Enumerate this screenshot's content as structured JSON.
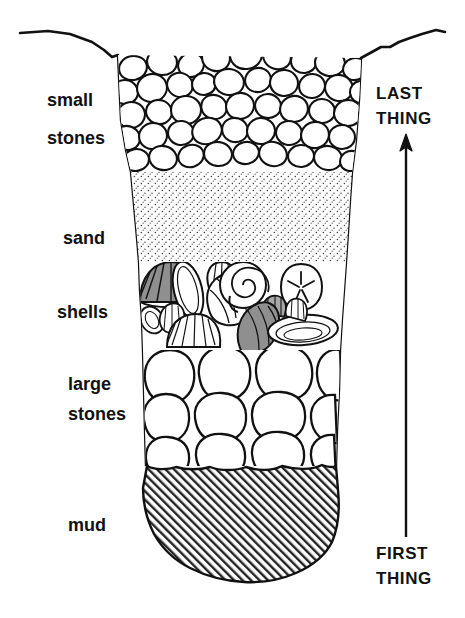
{
  "figure": {
    "type": "cross-section-diagram",
    "width": 465,
    "height": 618,
    "background_color": "#ffffff",
    "ink_color": "#111111"
  },
  "labels": {
    "small_stones_line1": "small",
    "small_stones_line2": "stones",
    "sand": "sand",
    "shells": "shells",
    "large_stones_line1": "large",
    "large_stones_line2": "stones",
    "mud": "mud"
  },
  "time_axis": {
    "top_line1": "LAST",
    "top_line2": "THING",
    "bottom_line1": "FIRST",
    "bottom_line2": "THING",
    "direction": "upward",
    "arrow_x": 406,
    "arrow_tip_y": 135,
    "arrow_tail_y": 537
  },
  "layers": [
    {
      "id": "small-stones",
      "name": "small stones",
      "order_from_top": 1,
      "deposition_order": 5,
      "fill_pattern": "small-pebbles",
      "top_y": 55,
      "bottom_y": 172,
      "fill_color": "#ffffff"
    },
    {
      "id": "sand",
      "name": "sand",
      "order_from_top": 2,
      "deposition_order": 4,
      "fill_pattern": "stipple-dots",
      "top_y": 172,
      "bottom_y": 262,
      "fill_color": "#ffffff"
    },
    {
      "id": "shells",
      "name": "shells",
      "order_from_top": 3,
      "deposition_order": 3,
      "fill_pattern": "shell-assemblage",
      "top_y": 262,
      "bottom_y": 350,
      "fill_color": "#ffffff"
    },
    {
      "id": "large-stones",
      "name": "large stones",
      "order_from_top": 4,
      "deposition_order": 2,
      "fill_pattern": "large-cobbles",
      "top_y": 350,
      "bottom_y": 466,
      "fill_color": "#ffffff"
    },
    {
      "id": "mud",
      "name": "mud",
      "order_from_top": 5,
      "deposition_order": 1,
      "fill_pattern": "diagonal-hatch",
      "top_y": 466,
      "bottom_y": 582,
      "fill_color": "#ffffff"
    }
  ],
  "shell_items": [
    {
      "id": "scallop-gray-left",
      "kind": "scallop",
      "shade": "gray",
      "fill": "#8f8f8f"
    },
    {
      "id": "clam-white-1",
      "kind": "clam",
      "shade": "white",
      "fill": "#ffffff"
    },
    {
      "id": "cockle-white",
      "kind": "cockle",
      "shade": "white",
      "fill": "#ffffff"
    },
    {
      "id": "whelk-white",
      "kind": "whelk",
      "shade": "white",
      "fill": "#ffffff"
    },
    {
      "id": "spiral-snail",
      "kind": "spiral-snail",
      "shade": "white",
      "fill": "#ffffff"
    },
    {
      "id": "sand-dollar",
      "kind": "sand-dollar",
      "shade": "white",
      "fill": "#ffffff"
    },
    {
      "id": "scallop-white-small",
      "kind": "scallop",
      "shade": "white",
      "fill": "#ffffff"
    },
    {
      "id": "conch-gray",
      "kind": "conch",
      "shade": "gray",
      "fill": "#8f8f8f"
    },
    {
      "id": "limpet-gray-small",
      "kind": "limpet",
      "shade": "gray",
      "fill": "#a8a8a8"
    },
    {
      "id": "clam-ribbed-right",
      "kind": "clam",
      "shade": "white",
      "fill": "#ffffff"
    },
    {
      "id": "mussel-white",
      "kind": "mussel",
      "shade": "white",
      "fill": "#ffffff"
    }
  ],
  "colors": {
    "ink": "#111111",
    "shell_gray": "#8f8f8f",
    "shell_gray_light": "#a8a8a8",
    "paper": "#ffffff"
  }
}
